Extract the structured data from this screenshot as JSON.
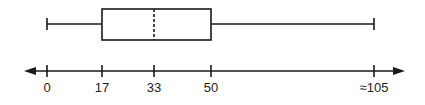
{
  "chart_data": {
    "type": "boxplot",
    "title": "",
    "xlabel": "",
    "ylabel": "",
    "summary": {
      "min": 0,
      "q1": 17,
      "median": 33,
      "q3": 50,
      "max": 105
    },
    "median_style": "dashed",
    "axis": {
      "ticks": [
        0,
        17,
        33,
        50,
        105
      ],
      "tick_labels": [
        "0",
        "17",
        "33",
        "50",
        "≈105"
      ],
      "arrows": "both",
      "grid": false
    }
  },
  "layout": {
    "axis_y": 71,
    "box_top": 9,
    "box_bottom": 40,
    "whisker_y": 24,
    "tick_px": [
      47,
      102,
      154,
      211,
      374
    ],
    "axis_left": 24,
    "axis_right": 405
  },
  "colors": {
    "stroke": "#1a1a1a",
    "text": "#222222",
    "background": "#ffffff"
  }
}
